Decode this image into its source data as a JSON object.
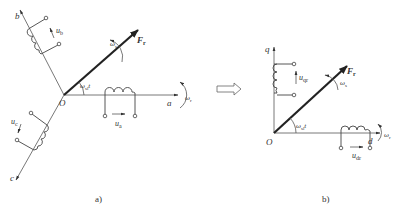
{
  "diagram": {
    "panel_a": {
      "caption": "a)",
      "origin_label": "O",
      "axes": [
        {
          "name": "a",
          "label": "a"
        },
        {
          "name": "b",
          "label": "b"
        },
        {
          "name": "c",
          "label": "c"
        }
      ],
      "voltages": [
        {
          "label": "u",
          "subscript": "a"
        },
        {
          "label": "u",
          "subscript": "b"
        },
        {
          "label": "u",
          "subscript": "c"
        }
      ],
      "vector": {
        "label": "F",
        "subscript": "r"
      },
      "angle": {
        "label": "ω",
        "subscript": "sl",
        "suffix": "t"
      },
      "vector_speed": {
        "label": "ω",
        "subscript": "s"
      },
      "rotor_speed": {
        "label": "ω",
        "subscript": "r"
      }
    },
    "transform_arrow": "⇨",
    "panel_b": {
      "caption": "b)",
      "origin_label": "O",
      "axes": [
        {
          "name": "d",
          "label": "d"
        },
        {
          "name": "q",
          "label": "q"
        }
      ],
      "voltages": [
        {
          "label": "u",
          "subscript": "dr"
        },
        {
          "label": "u",
          "subscript": "qr"
        }
      ],
      "vector": {
        "label": "F",
        "subscript": "r"
      },
      "angle": {
        "label": "ω",
        "subscript": "sl",
        "suffix": "t"
      },
      "vector_speed": {
        "label": "ω",
        "subscript": "s"
      },
      "rotor_speed": {
        "label": "ω",
        "subscript": "r"
      }
    }
  }
}
